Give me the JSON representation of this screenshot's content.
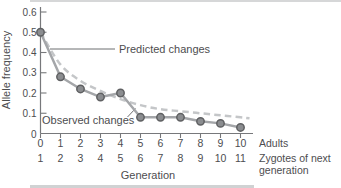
{
  "window": {
    "background": "#ffffff",
    "top_rule_color": "#d6d7d8",
    "bottom_rule_color": "#d0d2d3"
  },
  "colors": {
    "axis": "#77787b",
    "text": "#4d4d4f",
    "pointer": "#6d6e71"
  },
  "chart_data": {
    "type": "line",
    "title": "",
    "ylabel": "Allele frequency",
    "xlabel": "Generation",
    "ylim": [
      0,
      0.6
    ],
    "yticks": [
      0.1,
      0.2,
      0.3,
      0.4,
      0.5,
      0.6
    ],
    "y_origin_label": "0",
    "x": [
      0,
      1,
      2,
      3,
      4,
      5,
      6,
      7,
      8,
      9,
      10
    ],
    "x_ticks_adults": [
      "0",
      "1",
      "2",
      "3",
      "4",
      "5",
      "6",
      "7",
      "8",
      "9",
      "10"
    ],
    "x_ticks_zygotes": [
      "1",
      "2",
      "3",
      "4",
      "5",
      "6",
      "7",
      "8",
      "9",
      "10",
      "11"
    ],
    "x_row_labels": {
      "adults": "Adults",
      "zygotes_line1": "Zygotes of next",
      "zygotes_line2": "generation"
    },
    "grid": false,
    "legend_position": "inline-annotations",
    "series": [
      {
        "name": "Predicted changes",
        "style": "dashed",
        "color": "#c4c6c8",
        "values": [
          0.5,
          0.34,
          0.26,
          0.21,
          0.17,
          0.14,
          0.12,
          0.11,
          0.1,
          0.09,
          0.08
        ]
      },
      {
        "name": "Observed changes",
        "style": "solid-with-markers",
        "color": "#a4a6a9",
        "marker_fill": "#8b8d90",
        "marker_stroke": "#5f6062",
        "values": [
          0.5,
          0.28,
          0.22,
          0.18,
          0.2,
          0.08,
          0.08,
          0.08,
          0.06,
          0.05,
          0.03
        ]
      }
    ]
  }
}
